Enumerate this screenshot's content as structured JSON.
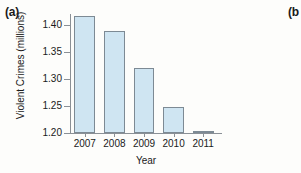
{
  "figure": {
    "panel_a_label": "(a)",
    "panel_b_label": "(b"
  },
  "chart_data": {
    "type": "bar",
    "title": "",
    "xlabel": "Year",
    "ylabel": "Violent Crimes (millions)",
    "categories": [
      "2007",
      "2008",
      "2009",
      "2010",
      "2011"
    ],
    "values": [
      1.416,
      1.389,
      1.321,
      1.248,
      1.203
    ],
    "ylim": [
      1.2,
      1.42
    ],
    "yticks": [
      1.2,
      1.25,
      1.3,
      1.35,
      1.4
    ],
    "ytick_labels": [
      "1.20",
      "1.25",
      "1.30",
      "1.35",
      "1.40"
    ],
    "grid": false,
    "legend": null,
    "bar_fill_color": "#cfe5f2",
    "bar_edge_color": "#7d8a94",
    "axis_color": "#8a9096",
    "background_color": "#fdfdfb"
  }
}
